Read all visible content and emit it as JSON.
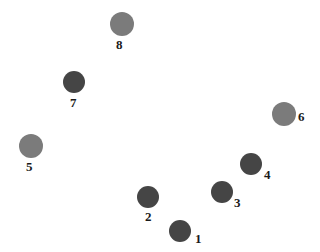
{
  "colors": {
    "light": "#7b7b7b",
    "dark": "#454545",
    "background": "#ffffff"
  },
  "nodes": [
    {
      "id": "1",
      "label": "1",
      "tone": "dark",
      "cx": 180,
      "cy": 231,
      "r": 11,
      "lx": 195,
      "ly": 232
    },
    {
      "id": "2",
      "label": "2",
      "tone": "dark",
      "cx": 148,
      "cy": 197,
      "r": 11,
      "lx": 145,
      "ly": 210
    },
    {
      "id": "3",
      "label": "3",
      "tone": "dark",
      "cx": 222,
      "cy": 192,
      "r": 11,
      "lx": 234,
      "ly": 196
    },
    {
      "id": "4",
      "label": "4",
      "tone": "dark",
      "cx": 251,
      "cy": 164,
      "r": 11,
      "lx": 264,
      "ly": 168
    },
    {
      "id": "5",
      "label": "5",
      "tone": "light",
      "cx": 31,
      "cy": 146,
      "r": 12,
      "lx": 26,
      "ly": 160
    },
    {
      "id": "6",
      "label": "6",
      "tone": "light",
      "cx": 284,
      "cy": 114,
      "r": 12,
      "lx": 298,
      "ly": 110
    },
    {
      "id": "7",
      "label": "7",
      "tone": "dark",
      "cx": 74,
      "cy": 82,
      "r": 11,
      "lx": 70,
      "ly": 96
    },
    {
      "id": "8",
      "label": "8",
      "tone": "light",
      "cx": 122,
      "cy": 24,
      "r": 12,
      "lx": 116,
      "ly": 38
    }
  ]
}
